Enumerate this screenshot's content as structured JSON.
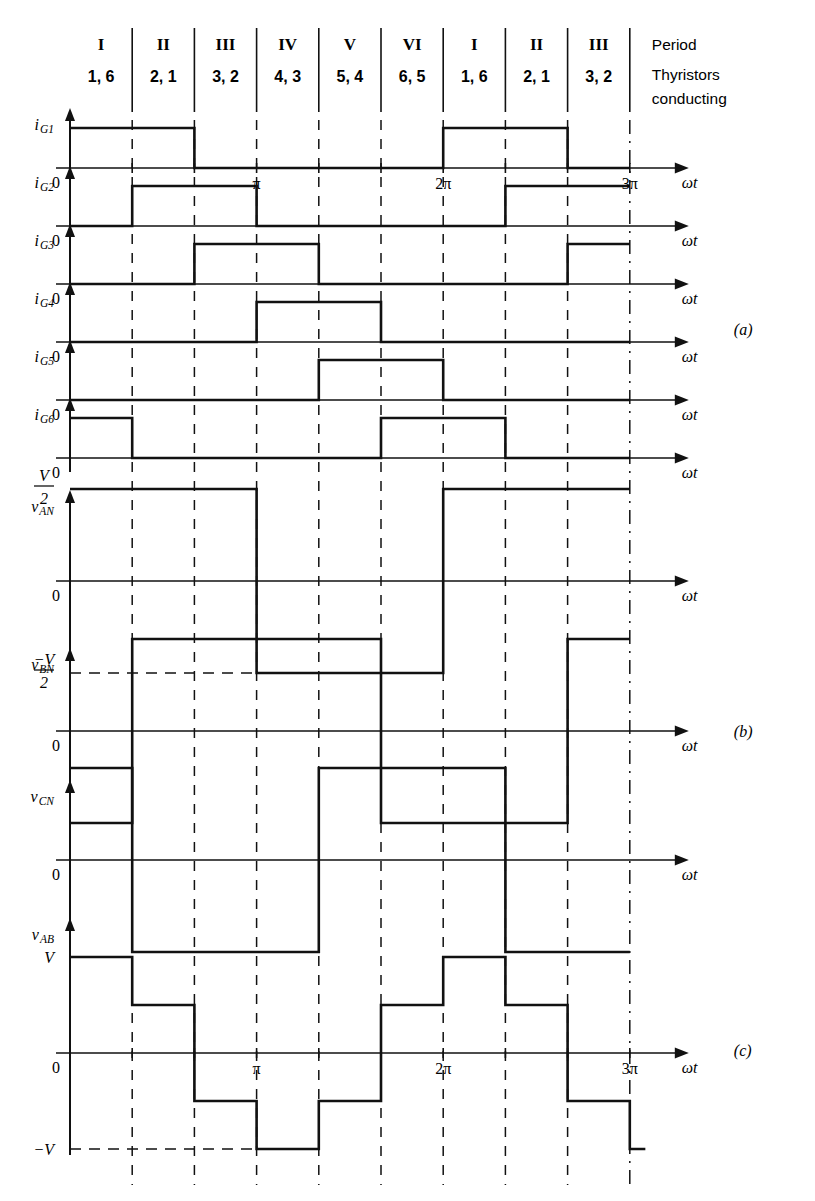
{
  "figure": {
    "panel_labels": [
      "(a)",
      "(b)",
      "(c)"
    ],
    "header": {
      "periods_roman": [
        "I",
        "II",
        "III",
        "IV",
        "V",
        "VI",
        "I",
        "II",
        "III"
      ],
      "thyristors": [
        "1, 6",
        "2, 1",
        "3, 2",
        "4, 3",
        "5, 4",
        "6, 5",
        "1, 6",
        "2, 1",
        "3, 2"
      ],
      "legend_line1": "Period",
      "legend_line2": "Thyristors",
      "legend_line3": "conducting"
    },
    "axis": {
      "x_label": "ωt",
      "zero_label": "0",
      "x_ticks": [
        {
          "label": "π",
          "period_index": 3
        },
        {
          "label": "2π",
          "period_index": 6
        },
        {
          "label": "3π",
          "period_index": 9
        }
      ],
      "n_periods": 9,
      "x_start_period": 0,
      "x_end_period": 9
    },
    "levels": {
      "half_v_num": "V",
      "half_v_den": "2",
      "neg_half_v_num": "−V",
      "neg_half_v_den": "2",
      "v_label": "V",
      "neg_v_label": "−V"
    }
  },
  "chart_data": {
    "type": "line",
    "xlabel": "ωt",
    "x_unit": "period (60° each)",
    "xlim": [
      0,
      9
    ],
    "grid": "vertical dashed period boundaries at every 60°",
    "legend": "none",
    "traces": [
      {
        "name": "i_G1",
        "label_main": "i",
        "label_sub": "G1",
        "panel": "(a)",
        "type": "gate-pulse",
        "levels": {
          "high": 1,
          "low": 0
        },
        "ylim": [
          0,
          1
        ],
        "segments": [
          {
            "from": 0,
            "to": 2,
            "value": 1
          },
          {
            "from": 2,
            "to": 6,
            "value": 0
          },
          {
            "from": 6,
            "to": 8,
            "value": 1
          },
          {
            "from": 8,
            "to": 9,
            "value": 0
          }
        ]
      },
      {
        "name": "i_G2",
        "label_main": "i",
        "label_sub": "G2",
        "panel": "(a)",
        "type": "gate-pulse",
        "levels": {
          "high": 1,
          "low": 0
        },
        "ylim": [
          0,
          1
        ],
        "segments": [
          {
            "from": 0,
            "to": 1,
            "value": 0
          },
          {
            "from": 1,
            "to": 3,
            "value": 1
          },
          {
            "from": 3,
            "to": 7,
            "value": 0
          },
          {
            "from": 7,
            "to": 9,
            "value": 1
          }
        ]
      },
      {
        "name": "i_G3",
        "label_main": "i",
        "label_sub": "G3",
        "panel": "(a)",
        "type": "gate-pulse",
        "levels": {
          "high": 1,
          "low": 0
        },
        "ylim": [
          0,
          1
        ],
        "segments": [
          {
            "from": 0,
            "to": 2,
            "value": 0
          },
          {
            "from": 2,
            "to": 4,
            "value": 1
          },
          {
            "from": 4,
            "to": 8,
            "value": 0
          },
          {
            "from": 8,
            "to": 9,
            "value": 1
          }
        ]
      },
      {
        "name": "i_G4",
        "label_main": "i",
        "label_sub": "G4",
        "panel": "(a)",
        "type": "gate-pulse",
        "levels": {
          "high": 1,
          "low": 0
        },
        "ylim": [
          0,
          1
        ],
        "segments": [
          {
            "from": 0,
            "to": 3,
            "value": 0
          },
          {
            "from": 3,
            "to": 5,
            "value": 1
          },
          {
            "from": 5,
            "to": 9,
            "value": 0
          }
        ]
      },
      {
        "name": "i_G5",
        "label_main": "i",
        "label_sub": "G5",
        "panel": "(a)",
        "type": "gate-pulse",
        "levels": {
          "high": 1,
          "low": 0
        },
        "ylim": [
          0,
          1
        ],
        "segments": [
          {
            "from": 0,
            "to": 4,
            "value": 0
          },
          {
            "from": 4,
            "to": 6,
            "value": 1
          },
          {
            "from": 6,
            "to": 9,
            "value": 0
          }
        ]
      },
      {
        "name": "i_G6",
        "label_main": "i",
        "label_sub": "G6",
        "panel": "(a)",
        "type": "gate-pulse",
        "levels": {
          "high": 1,
          "low": 0
        },
        "ylim": [
          0,
          1
        ],
        "segments": [
          {
            "from": 0,
            "to": 1,
            "value": 1
          },
          {
            "from": 1,
            "to": 5,
            "value": 0
          },
          {
            "from": 5,
            "to": 7,
            "value": 1
          },
          {
            "from": 7,
            "to": 9,
            "value": 0
          }
        ]
      },
      {
        "name": "v_AN",
        "label_main": "v",
        "label_sub": "AN",
        "panel": "(b)",
        "type": "square-wave",
        "levels": {
          "pos": "V/2",
          "neg": "-V/2"
        },
        "ylim": [
          -0.5,
          0.5
        ],
        "segments": [
          {
            "from": 0,
            "to": 3,
            "value": 0.5
          },
          {
            "from": 3,
            "to": 6,
            "value": -0.5
          },
          {
            "from": 6,
            "to": 9,
            "value": 0.5
          }
        ]
      },
      {
        "name": "v_BN",
        "label_main": "v",
        "label_sub": "BN",
        "panel": "(b)",
        "type": "square-wave",
        "levels": {
          "pos": "V/2",
          "neg": "-V/2"
        },
        "ylim": [
          -0.5,
          0.5
        ],
        "segments": [
          {
            "from": 0,
            "to": 1,
            "value": -0.5
          },
          {
            "from": 1,
            "to": 2,
            "value": 0.5
          },
          {
            "from": 2,
            "to": 5,
            "value": 0.5
          },
          {
            "from": 5,
            "to": 8,
            "value": -0.5
          },
          {
            "from": 8,
            "to": 9,
            "value": 0.5
          }
        ]
      },
      {
        "name": "v_CN",
        "label_main": "v",
        "label_sub": "CN",
        "panel": "(b)",
        "type": "square-wave",
        "levels": {
          "pos": "V/2",
          "neg": "-V/2"
        },
        "ylim": [
          -0.5,
          0.5
        ],
        "segments": [
          {
            "from": 0,
            "to": 1,
            "value": 0.5
          },
          {
            "from": 1,
            "to": 4,
            "value": -0.5
          },
          {
            "from": 4,
            "to": 7,
            "value": 0.5
          },
          {
            "from": 7,
            "to": 9,
            "value": -0.5
          }
        ]
      },
      {
        "name": "v_AB",
        "label_main": "v",
        "label_sub": "AB",
        "panel": "(c)",
        "type": "six-step",
        "levels": {
          "pos_full": "V",
          "pos_half": "V/2",
          "neg_half": "-V/2",
          "neg_full": "-V"
        },
        "ylim": [
          -1,
          1
        ],
        "segments": [
          {
            "from": 0,
            "to": 1,
            "value": 1.0
          },
          {
            "from": 1,
            "to": 2,
            "value": 0.5
          },
          {
            "from": 2,
            "to": 3,
            "value": -0.5
          },
          {
            "from": 3,
            "to": 4,
            "value": -1.0
          },
          {
            "from": 4,
            "to": 5,
            "value": -0.5
          },
          {
            "from": 5,
            "to": 6,
            "value": 0.5
          },
          {
            "from": 6,
            "to": 7,
            "value": 1.0
          },
          {
            "from": 7,
            "to": 8,
            "value": 0.5
          },
          {
            "from": 8,
            "to": 9,
            "value": -0.5
          },
          {
            "from": 9,
            "to": 9.25,
            "value": -1.0
          }
        ]
      }
    ]
  }
}
